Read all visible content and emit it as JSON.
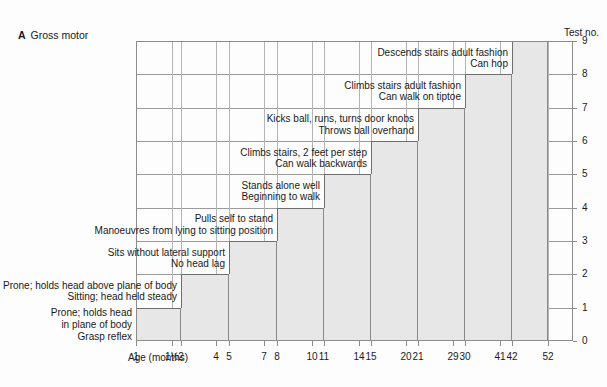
{
  "panel": {
    "letter": "A",
    "title": "Gross motor"
  },
  "axes": {
    "y_axis_title": "Test no.",
    "x_axis_title": "Age (months)"
  },
  "chart_data": {
    "type": "area",
    "xlabel": "Age (months)",
    "ylabel": "Test no.",
    "grid": true,
    "legend": "none",
    "ylim": [
      0,
      9
    ],
    "y_ticks": [
      "0",
      "1",
      "2",
      "3",
      "4",
      "5",
      "6",
      "7",
      "8",
      "9"
    ],
    "x_ticks": [
      "1",
      "1½",
      "2",
      "4",
      "5",
      "7",
      "8",
      "10",
      "11",
      "14",
      "15",
      "20",
      "21",
      "29",
      "30",
      "41",
      "42",
      "52"
    ],
    "steps": [
      {
        "test_no": 1,
        "age_start": "1",
        "age_end": "2",
        "milestones": [
          "Prone; holds head",
          "in plane of body",
          "Grasp reflex"
        ]
      },
      {
        "test_no": 2,
        "age_start": "2",
        "age_end": "5",
        "milestones": [
          "Prone; holds head above plane of body",
          "Sitting; head held steady"
        ]
      },
      {
        "test_no": 3,
        "age_start": "5",
        "age_end": "8",
        "milestones": [
          "Sits without lateral support",
          "No head lag"
        ]
      },
      {
        "test_no": 4,
        "age_start": "8",
        "age_end": "11",
        "milestones": [
          "Pulls self to stand",
          "Manoeuvres from lying to sitting position"
        ]
      },
      {
        "test_no": 5,
        "age_start": "11",
        "age_end": "15",
        "milestones": [
          "Stands alone well",
          "Beginning to walk"
        ]
      },
      {
        "test_no": 6,
        "age_start": "15",
        "age_end": "21",
        "milestones": [
          "Climbs stairs, 2 feet per step",
          "Can walk backwards"
        ]
      },
      {
        "test_no": 7,
        "age_start": "21",
        "age_end": "30",
        "milestones": [
          "Kicks ball, runs, turns door knobs",
          "Throws ball overhand"
        ]
      },
      {
        "test_no": 8,
        "age_start": "30",
        "age_end": "42",
        "milestones": [
          "Climbs stairs adult fashion",
          "Can walk on tiptoe"
        ]
      },
      {
        "test_no": 9,
        "age_start": "42",
        "age_end": "52",
        "milestones": [
          "Descends stairs adult fashion",
          "Can hop"
        ]
      }
    ]
  }
}
